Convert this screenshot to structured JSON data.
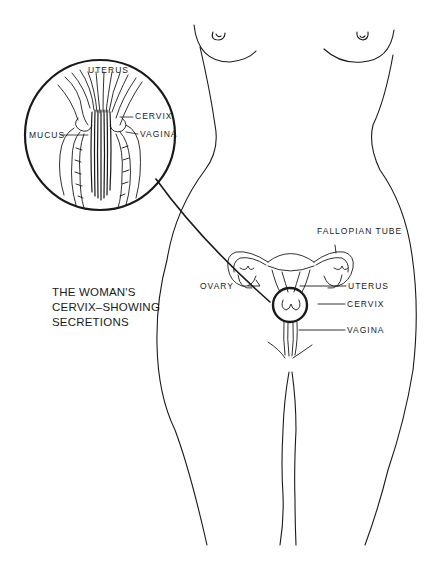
{
  "diagram": {
    "caption_lines": [
      "THE WOMAN'S",
      "CERVIX–SHOWING",
      "SECRETIONS"
    ],
    "inset": {
      "labels": {
        "uterus": "UTERUS",
        "cervix": "CERVIX",
        "mucus": "MUCUS",
        "vagina": "VAGINA"
      }
    },
    "main": {
      "labels": {
        "fallopian_tube": "FALLOPIAN TUBE",
        "ovary": "OVARY",
        "uterus": "UTERUS",
        "cervix": "CERVIX",
        "vagina": "VAGINA"
      }
    },
    "colors": {
      "line": "#1a1a1a",
      "background": "#ffffff"
    }
  }
}
